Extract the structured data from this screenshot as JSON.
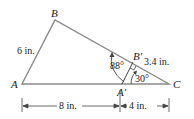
{
  "diagram": {
    "type": "geometry",
    "vertices": {
      "A": "A",
      "B": "B",
      "C": "C",
      "A_prime": "A′",
      "B_prime": "B′"
    },
    "measurements": {
      "AB": "6 in.",
      "BprimeC": "3.4 in.",
      "AAprime": "8 in.",
      "AprimeC": "4 in.",
      "angle_AprimeBprime": "88°",
      "angle_C": "30°"
    },
    "colors": {
      "triangle_stroke": "#8a8a8a",
      "ink": "#222222"
    }
  }
}
